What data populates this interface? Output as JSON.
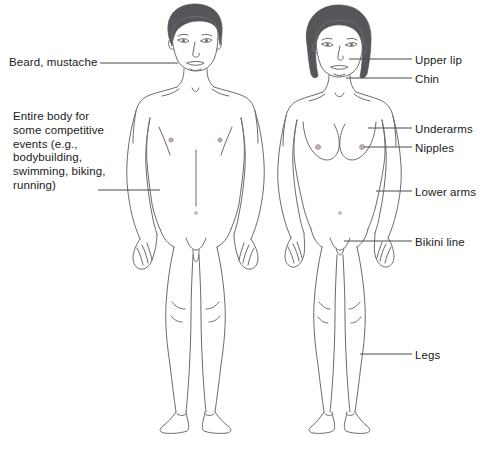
{
  "diagram": {
    "background_color": "#ffffff",
    "outline_color": "#6b6b70",
    "hair_color": "#55555a",
    "leader_line_color": "#4a4a4a",
    "text_color": "#1a1a1a",
    "figures": [
      {
        "name": "male-figure",
        "caption_side": "left"
      },
      {
        "name": "female-figure",
        "caption_side": "right"
      }
    ],
    "labels_left": [
      {
        "id": "beard",
        "text": "Beard, mustache",
        "anchor_x": 178,
        "anchor_y": 63
      },
      {
        "id": "entire-body",
        "text": "Entire body for\nsome competitive\nevents (e.g.,\nbodybuilding,\nswimming, biking,\nrunning)",
        "anchor_x": 160,
        "anchor_y": 190
      }
    ],
    "labels_right": [
      {
        "id": "upper-lip",
        "text": "Upper lip",
        "anchor_x": 349,
        "anchor_y": 60
      },
      {
        "id": "chin",
        "text": "Chin",
        "anchor_x": 346,
        "anchor_y": 79
      },
      {
        "id": "underarms",
        "text": "Underarms",
        "anchor_x": 368,
        "anchor_y": 129
      },
      {
        "id": "nipples",
        "text": "Nipples",
        "anchor_x": 364,
        "anchor_y": 148
      },
      {
        "id": "lower-arms",
        "text": "Lower arms",
        "anchor_x": 376,
        "anchor_y": 192
      },
      {
        "id": "bikini-line",
        "text": "Bikini line",
        "anchor_x": 344,
        "anchor_y": 242
      },
      {
        "id": "legs",
        "text": "Legs",
        "anchor_x": 360,
        "anchor_y": 355
      }
    ],
    "page_artifact": "  "
  }
}
